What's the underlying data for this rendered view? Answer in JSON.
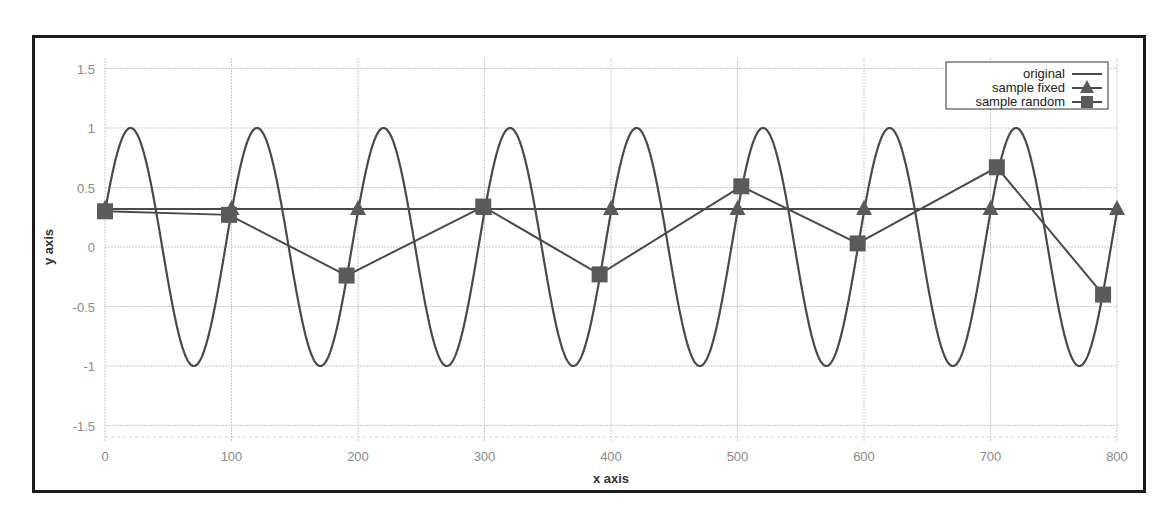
{
  "chart_data": {
    "type": "line",
    "title": "",
    "xlabel": "x axis",
    "ylabel": "y axis",
    "xlim": [
      0,
      800
    ],
    "ylim": [
      -1.6,
      1.6
    ],
    "xticks": [
      0,
      100,
      200,
      300,
      400,
      500,
      600,
      700,
      800
    ],
    "xtick_labels": [
      "0",
      "100",
      "200",
      "300",
      "400",
      "500",
      "600",
      "700",
      "800"
    ],
    "yticks": [
      1.5,
      1,
      0.5,
      0,
      -0.5,
      -1,
      -1.5
    ],
    "ytick_labels": [
      "1.5",
      "1",
      "0.5",
      "0",
      "-0.5",
      "-1",
      "-1.5"
    ],
    "grid": true,
    "legend_position": "top-right",
    "series": [
      {
        "name": "original",
        "marker": "none",
        "description": "sinusoid y = sin(2*pi*x/100 + 0.3), period 100, amplitude 1",
        "function": {
          "amplitude": 1,
          "period": 100,
          "phase": 0.3,
          "x_start": 0,
          "x_end": 800
        }
      },
      {
        "name": "sample fixed",
        "marker": "triangle",
        "x": [
          0,
          100,
          200,
          300,
          400,
          500,
          600,
          700,
          800
        ],
        "y": [
          0.32,
          0.32,
          0.32,
          0.32,
          0.32,
          0.32,
          0.32,
          0.32,
          0.32
        ]
      },
      {
        "name": "sample random",
        "marker": "square",
        "x": [
          0,
          98,
          191,
          299,
          391,
          503,
          595,
          705,
          789
        ],
        "y": [
          0.3,
          0.27,
          -0.24,
          0.34,
          -0.23,
          0.51,
          0.03,
          0.67,
          -0.4
        ]
      }
    ]
  },
  "colors": {
    "line": "#4a4a4a",
    "grid": "#c8c8c8",
    "frame": "#1a1a1a",
    "tick_text": "#8a8a8a"
  }
}
